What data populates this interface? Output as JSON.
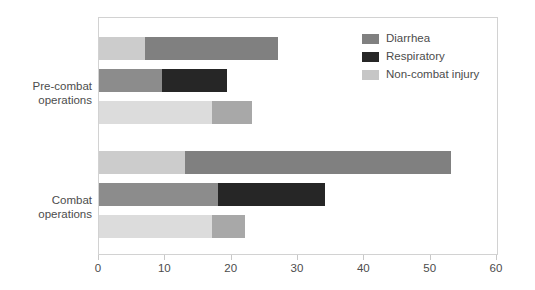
{
  "chart_data": {
    "type": "bar",
    "orientation": "horizontal",
    "stacked": true,
    "title": "",
    "xlabel": "",
    "ylabel": "",
    "xlim": [
      0,
      60
    ],
    "xticks": [
      0,
      10,
      20,
      30,
      40,
      50,
      60
    ],
    "xtick_labels": [
      "0",
      "10",
      "20",
      "30",
      "40",
      "50",
      "60"
    ],
    "grid": false,
    "legend_position": "top-right",
    "categories": [
      "Pre-combat operations",
      "Combat operations"
    ],
    "legend": [
      {
        "label": "Diarrhea",
        "color": "#808080"
      },
      {
        "label": "Respiratory",
        "color": "#262626"
      },
      {
        "label": "Non-combat injury",
        "color": "#c6c6c6"
      }
    ],
    "groups": [
      {
        "name": "Pre-combat operations",
        "label_line1": "Pre-combat",
        "label_line2": "operations",
        "bars": [
          {
            "name": "pre-combat-bar-1",
            "total": 27,
            "segments": [
              {
                "value": 7,
                "color": "#cccccc"
              },
              {
                "value": 20,
                "color": "#808080"
              }
            ]
          },
          {
            "name": "pre-combat-bar-2",
            "total": 19.3,
            "segments": [
              {
                "value": 9.5,
                "color": "#8c8c8c"
              },
              {
                "value": 9.8,
                "color": "#262626"
              }
            ]
          },
          {
            "name": "pre-combat-bar-3",
            "total": 23,
            "segments": [
              {
                "value": 17,
                "color": "#dcdcdc"
              },
              {
                "value": 6,
                "color": "#a8a8a8"
              }
            ]
          }
        ]
      },
      {
        "name": "Combat operations",
        "label_line1": "Combat",
        "label_line2": "operations",
        "bars": [
          {
            "name": "combat-bar-1",
            "total": 53,
            "segments": [
              {
                "value": 13,
                "color": "#cccccc"
              },
              {
                "value": 40,
                "color": "#808080"
              }
            ]
          },
          {
            "name": "combat-bar-2",
            "total": 34,
            "segments": [
              {
                "value": 18,
                "color": "#8c8c8c"
              },
              {
                "value": 16,
                "color": "#262626"
              }
            ]
          },
          {
            "name": "combat-bar-3",
            "total": 22,
            "segments": [
              {
                "value": 17,
                "color": "#dcdcdc"
              },
              {
                "value": 5,
                "color": "#a8a8a8"
              }
            ]
          }
        ]
      }
    ]
  }
}
